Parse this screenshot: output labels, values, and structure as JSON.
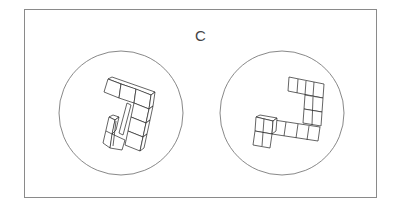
{
  "figure": {
    "label": "C",
    "panels": [
      {
        "id": "left",
        "figure": "cube-assembly-rotated-view-1"
      },
      {
        "id": "right",
        "figure": "cube-assembly-rotated-view-2"
      }
    ]
  }
}
